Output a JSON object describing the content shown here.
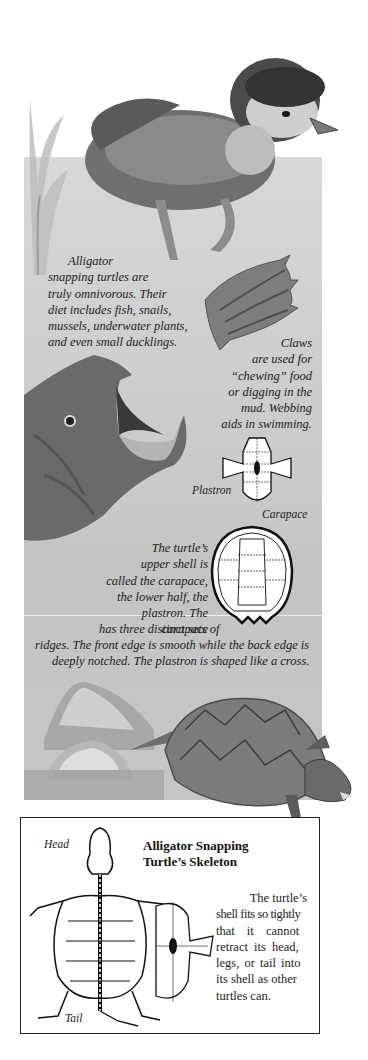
{
  "illustrations": {
    "duckling": "duckling-illustration",
    "seaweed": "seaweed-illustration",
    "claw": "turtle-claw-illustration",
    "turtle_head": "turtle-head-open-mouth-illustration",
    "plastron": "plastron-diagram",
    "carapace": "carapace-diagram",
    "rocks": "rocks-illustration",
    "turtle_full": "alligator-snapping-turtle-illustration",
    "skeleton": "turtle-skeleton-diagram"
  },
  "captions": {
    "diet": {
      "lines": [
        "Alligator",
        "snapping turtles are",
        "truly omnivorous. Their",
        "diet includes fish, snails,",
        "mussels, underwater plants,",
        "and even small ducklings."
      ]
    },
    "claws": {
      "lines": [
        "Claws",
        "are used for",
        "“chewing” food",
        "or digging in the",
        "mud. Webbing",
        "aids in swimming."
      ]
    },
    "shell": {
      "lines": [
        "The turtle’s",
        "upper shell is",
        "called the carapace,",
        "the lower half, the",
        "plastron. The carapace",
        "has three distinct sets of",
        "ridges. The front edge is smooth while the back edge is",
        "deeply notched. The plastron is shaped like a cross."
      ]
    }
  },
  "diagram_labels": {
    "plastron": "Plastron",
    "carapace": "Carapace",
    "head": "Head",
    "tail": "Tail"
  },
  "skeleton_box": {
    "title_line1": "Alligator Snapping",
    "title_line2": "Turtle’s Skeleton",
    "text_lines": [
      "The turtle’s",
      "shell fits so tightly",
      "that it cannot",
      "retract its head,",
      "legs, or tail into",
      "its shell as other",
      "turtles can."
    ]
  }
}
